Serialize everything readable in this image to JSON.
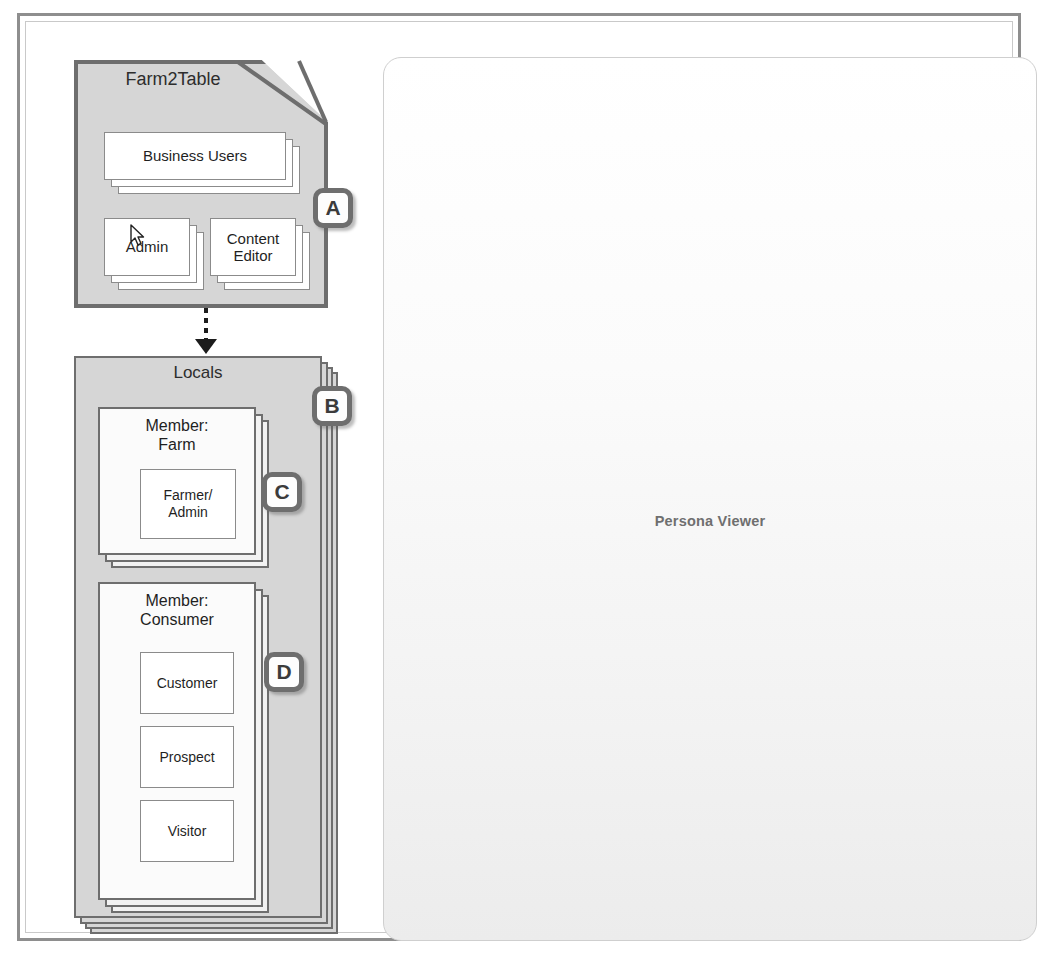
{
  "frame": {
    "label": "diagram-frame"
  },
  "viewer": {
    "title": "Persona Viewer",
    "marker": "E",
    "bg_top": "#ffffff",
    "bg_bottom": "#ececec",
    "border_color": "#cfcfcf"
  },
  "markers": {
    "a": "A",
    "b": "B",
    "c": "C",
    "d": "D",
    "e": "E"
  },
  "farm2table": {
    "title": "Farm2Table",
    "fill": "#d6d6d6",
    "border": "#6e6e6e",
    "cards": [
      {
        "label": "Business Users",
        "stacked": true
      },
      {
        "label": "Admin",
        "stacked": true
      },
      {
        "label": "Content Editor",
        "stacked": true
      }
    ]
  },
  "relation": {
    "type": "dashed-generalization-arrow",
    "from": "Farm2Table",
    "to": "Locals",
    "direction": "down"
  },
  "locals": {
    "title": "Locals",
    "fill": "#d6d6d6",
    "border": "#6e6e6e",
    "groups": [
      {
        "title": "Member:\nFarm",
        "title_line1": "Member:",
        "title_line2": "Farm",
        "roles": [
          {
            "label": "Farmer/ Admin",
            "line1": "Farmer/",
            "line2": "Admin"
          }
        ]
      },
      {
        "title": "Member:\nConsumer",
        "title_line1": "Member:",
        "title_line2": "Consumer",
        "roles": [
          {
            "label": "Customer",
            "line1": "Customer",
            "line2": ""
          },
          {
            "label": "Prospect",
            "line1": "Prospect",
            "line2": ""
          },
          {
            "label": "Visitor",
            "line1": "Visitor",
            "line2": ""
          }
        ]
      }
    ]
  },
  "cursor": {
    "name": "mouse-pointer",
    "over": "Admin"
  }
}
